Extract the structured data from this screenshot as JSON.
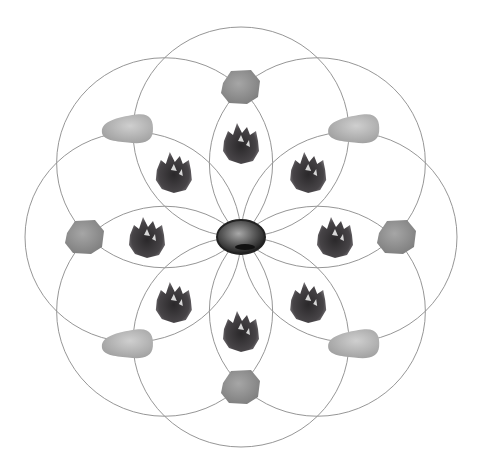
{
  "diagram": {
    "pattern": "eight-circle flower",
    "circle_count": 8,
    "line_color": "#8a8a8a",
    "background": "#ffffff",
    "center_stone": {
      "name": "center-stone",
      "type": "polished dark tumbled stone",
      "color": "#3a3a3a"
    },
    "ring_inner": {
      "name": "amethyst-cluster",
      "type": "amethyst cluster",
      "count": 8,
      "color": "#3f3c3f",
      "positions": [
        "top",
        "top-right",
        "right",
        "bottom-right",
        "bottom",
        "bottom-left",
        "left",
        "top-left"
      ]
    },
    "ring_outer_cardinal": {
      "name": "rough-stone",
      "type": "rough rounded stone",
      "count": 4,
      "color": "#8e8e8e",
      "positions": [
        "top",
        "right",
        "bottom",
        "left"
      ]
    },
    "ring_outer_diagonal": {
      "name": "tumbled-point",
      "type": "tumbled tapered stone",
      "count": 4,
      "color": "#b4b4b4",
      "positions": [
        "top-right",
        "bottom-right",
        "bottom-left",
        "top-left"
      ]
    }
  }
}
